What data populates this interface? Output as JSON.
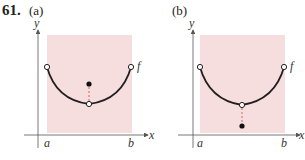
{
  "problem": {
    "number": "61.",
    "colors": {
      "region": "#f6dede",
      "curve": "#231f20",
      "axis": "#444444",
      "dash": "#d9534f"
    },
    "panels": [
      {
        "label": "(a)",
        "y_axis_label": "y",
        "x_axis_label": "x",
        "a_label": "a",
        "b_label": "b",
        "function_label": "f",
        "isolated_point": "above minimum"
      },
      {
        "label": "(b)",
        "y_axis_label": "y",
        "x_axis_label": "x",
        "a_label": "a",
        "b_label": "b",
        "function_label": "f",
        "isolated_point": "below minimum"
      }
    ]
  }
}
